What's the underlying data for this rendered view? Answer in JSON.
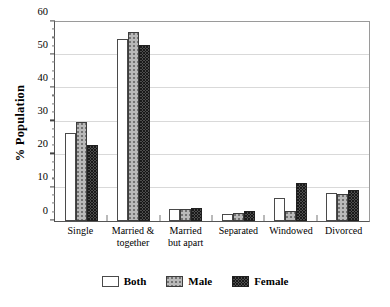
{
  "chart_data": {
    "type": "bar",
    "title": "",
    "xlabel": "",
    "ylabel": "% Population",
    "ylim": [
      0,
      60
    ],
    "ytick_values": [
      0,
      10,
      20,
      30,
      40,
      50,
      60
    ],
    "ytick_labels": [
      "0",
      "10",
      "20",
      "30",
      "40",
      "50",
      "60"
    ],
    "yminor_step": 2.5,
    "grid": "horizontal-major",
    "legend_position": "bottom-center",
    "categories": [
      "Single",
      "Married &\ntogether",
      "Married\nbut apart",
      "Separated",
      "Windowed",
      "Divorced"
    ],
    "series": [
      {
        "name": "Both",
        "color": "#ffffff",
        "values": [
          26.5,
          55.0,
          3.5,
          2.0,
          7.0,
          8.5
        ]
      },
      {
        "name": "Male",
        "color": "#b9b9b9",
        "values": [
          30.0,
          57.0,
          3.5,
          2.5,
          3.0,
          8.0
        ]
      },
      {
        "name": "Female",
        "color": "#4d4d4d",
        "values": [
          23.0,
          53.0,
          4.0,
          3.0,
          11.5,
          9.5
        ]
      }
    ]
  },
  "legend": {
    "items": [
      {
        "label": "Both"
      },
      {
        "label": "Male"
      },
      {
        "label": "Female"
      }
    ]
  }
}
